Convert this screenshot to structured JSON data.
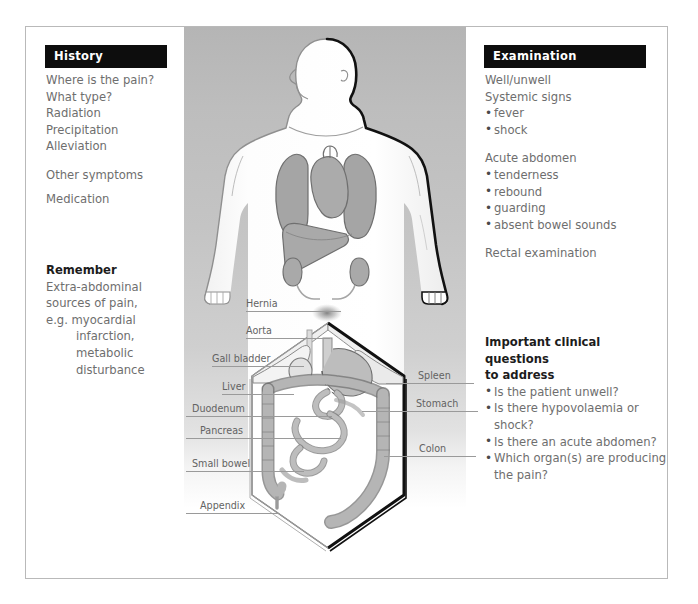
{
  "history": {
    "title": "History",
    "items": [
      "Where is the pain?",
      "What type?",
      "Radiation",
      "Precipitation",
      "Alleviation"
    ],
    "other_symptoms": "Other symptoms",
    "medication": "Medication",
    "remember_title": "Remember",
    "remember_lines": [
      "Extra-abdominal",
      "sources of pain,",
      "e.g. myocardial"
    ],
    "remember_indented": [
      "infarction,",
      "metabolic",
      "disturbance"
    ]
  },
  "examination": {
    "title": "Examination",
    "well_unwell": "Well/unwell",
    "systemic_signs": "Systemic signs",
    "systemic_items": [
      "fever",
      "shock"
    ],
    "acute_abdomen": "Acute abdomen",
    "acute_items": [
      "tenderness",
      "rebound",
      "guarding",
      "absent bowel sounds"
    ],
    "rectal_examination": "Rectal examination"
  },
  "clinical_questions": {
    "title_line1": "Important clinical questions",
    "title_line2": "to address",
    "items": [
      [
        "Is the patient unwell?"
      ],
      [
        "Is there hypovolaemia or",
        "shock?"
      ],
      [
        "Is there an acute abdomen?"
      ],
      [
        "Which organ(s) are producing",
        "the pain?"
      ]
    ]
  },
  "anatomy_labels": {
    "left": [
      "Hernia",
      "Aorta",
      "Gall bladder",
      "Liver",
      "Duodenum",
      "Pancreas",
      "Small bowel",
      "Appendix"
    ],
    "right": [
      "Spleen",
      "Stomach",
      "Colon"
    ]
  },
  "colors": {
    "header_bg": "#0d0d0d",
    "header_text": "#ffffff",
    "body_text": "#6e6e6e",
    "heading_text": "#1c1c1c",
    "label_text": "#636363",
    "organ_fill": "#a9a9a9",
    "organ_stroke": "#6f6f6f",
    "body_fill": "#fbfbfb",
    "panel_gradient_top": "#b5b5b5",
    "panel_gradient_bottom": "#f4f4f4",
    "frame_border": "#b9b9b9"
  }
}
